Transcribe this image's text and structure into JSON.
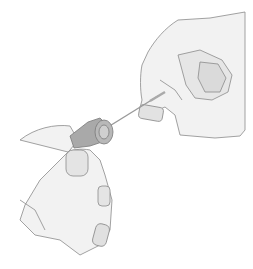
{
  "image": {
    "alt": "Pencil illustration of two hands: one hand holding a needle cap, the other pulling out a thin needle",
    "style": "pencil sketch, grayscale",
    "colors": {
      "background": "#ffffff",
      "skin": "#f1f1f1",
      "outline": "#8a8a8a",
      "shade": "#cfcfcf",
      "cap": "#a9a9a9",
      "needle": "#9a9a9a"
    }
  }
}
